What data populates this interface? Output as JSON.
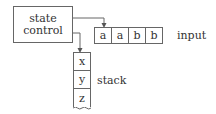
{
  "state_control": {
    "lines": [
      "state",
      "control"
    ]
  },
  "input": {
    "label": "input",
    "cells": [
      "a",
      "a",
      "b",
      "b"
    ]
  },
  "stack": {
    "label": "stack",
    "cells": [
      "x",
      "y",
      "z"
    ]
  },
  "colors": {
    "stroke": "#666666",
    "text": "#333333"
  }
}
